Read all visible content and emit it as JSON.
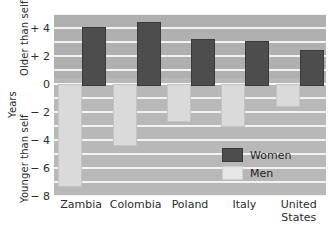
{
  "chart_data": {
    "type": "bar",
    "title": "",
    "subtitle": "",
    "xlabel": "",
    "ylabel": "Years",
    "ylabel_top": "Older than self",
    "ylabel_bottom": "Younger than self",
    "categories": [
      "Zambia",
      "Colombia",
      "Poland",
      "Italy",
      "United States"
    ],
    "category_lines": [
      [
        "Zambia"
      ],
      [
        "Colombia"
      ],
      [
        "Poland"
      ],
      [
        "Italy"
      ],
      [
        "United",
        "States"
      ]
    ],
    "series": [
      {
        "name": "Women",
        "color": "#4d4d4d",
        "values": [
          4.1,
          4.4,
          3.2,
          3.1,
          2.4
        ]
      },
      {
        "name": "Men",
        "color": "#dadada",
        "values": [
          -7.2,
          -4.3,
          -2.6,
          -2.9,
          -1.5
        ]
      }
    ],
    "ylim": [
      -8,
      5
    ],
    "yticks": [
      4,
      2,
      0,
      -2,
      -4,
      -6,
      -8
    ],
    "ytick_labels": [
      "+ 4",
      "+ 2",
      "0",
      "− 2",
      "− 4",
      "− 6",
      "− 8"
    ],
    "gridlines": [
      5,
      4,
      3,
      2,
      1,
      0,
      -1,
      -2,
      -3,
      -4,
      -5,
      -6,
      -7,
      -8
    ],
    "grid": true,
    "legend_position": "inside-bottom-right",
    "plot_background": "#b0b0b0",
    "plot_background_lower": "#b8b8b8",
    "gridline_color": "#f2f2f2"
  },
  "legend": {
    "items": [
      {
        "label": "Women",
        "swatch": "women"
      },
      {
        "label": "Men",
        "swatch": "men"
      }
    ]
  }
}
